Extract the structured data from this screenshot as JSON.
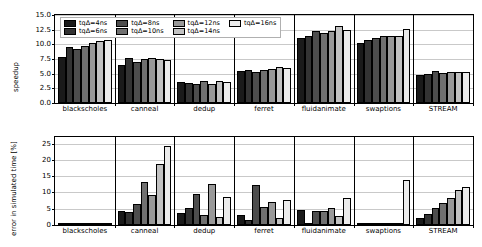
{
  "figure": {
    "panels": [
      "speedup",
      "error"
    ]
  },
  "legend": {
    "entries": [
      {
        "label": "tqΔ=4ns",
        "color": "#1a1a1a"
      },
      {
        "label": "tqΔ=6ns",
        "color": "#333333"
      },
      {
        "label": "tqΔ=8ns",
        "color": "#4d4d4d"
      },
      {
        "label": "tqΔ=10ns",
        "color": "#707070"
      },
      {
        "label": "tqΔ=12ns",
        "color": "#999999"
      },
      {
        "label": "tqΔ=14ns",
        "color": "#c2c2c2"
      },
      {
        "label": "tqΔ=16ns",
        "color": "#ebebeb"
      }
    ]
  },
  "chart_data": [
    {
      "type": "bar",
      "title": "",
      "xlabel": "",
      "ylabel": "speedup",
      "ylim": [
        0.0,
        15.0
      ],
      "yticks": [
        "0.0",
        "2.5",
        "5.0",
        "7.5",
        "10.0",
        "12.5",
        "15.0"
      ],
      "ytick_values": [
        0.0,
        2.5,
        5.0,
        7.5,
        10.0,
        12.5,
        15.0
      ],
      "grid": true,
      "legend_position": "upper left",
      "categories": [
        "blackscholes",
        "canneal",
        "dedup",
        "ferret",
        "fluidanimate",
        "swaptions",
        "STREAM"
      ],
      "series": [
        {
          "name": "tqΔ=4ns",
          "values": [
            7.8,
            6.4,
            3.5,
            5.5,
            11.1,
            10.3,
            4.7
          ]
        },
        {
          "name": "tqΔ=6ns",
          "values": [
            9.5,
            7.7,
            3.4,
            5.6,
            11.5,
            10.8,
            5.0
          ]
        },
        {
          "name": "tqΔ=8ns",
          "values": [
            9.2,
            7.0,
            3.3,
            5.3,
            12.2,
            11.1,
            5.5
          ]
        },
        {
          "name": "tqΔ=10ns",
          "values": [
            9.8,
            7.5,
            3.7,
            5.6,
            12.0,
            11.4,
            5.2
          ]
        },
        {
          "name": "tqΔ=12ns",
          "values": [
            10.2,
            7.7,
            3.2,
            5.8,
            12.3,
            11.4,
            5.3
          ]
        },
        {
          "name": "tqΔ=14ns",
          "values": [
            10.5,
            7.5,
            3.8,
            6.1,
            13.1,
            11.5,
            5.3
          ]
        },
        {
          "name": "tqΔ=16ns",
          "values": [
            10.8,
            7.3,
            3.6,
            5.9,
            12.4,
            12.6,
            5.35
          ]
        }
      ]
    },
    {
      "type": "bar",
      "title": "",
      "xlabel": "",
      "ylabel": "error in simulated time [%]",
      "ylim": [
        0,
        27
      ],
      "yticks": [
        "0",
        "5",
        "10",
        "15",
        "20",
        "25"
      ],
      "ytick_values": [
        0,
        5,
        10,
        15,
        20,
        25
      ],
      "grid": true,
      "legend_position": "none",
      "categories": [
        "blackscholes",
        "canneal",
        "dedup",
        "ferret",
        "fluidanimate",
        "swaptions",
        "STREAM"
      ],
      "series": [
        {
          "name": "tqΔ=4ns",
          "values": [
            0.15,
            4.3,
            3.7,
            3.0,
            4.7,
            0.1,
            2.2
          ]
        },
        {
          "name": "tqΔ=6ns",
          "values": [
            0.12,
            4.0,
            5.3,
            1.4,
            0.3,
            0.1,
            3.5
          ]
        },
        {
          "name": "tqΔ=8ns",
          "values": [
            0.18,
            6.3,
            9.6,
            12.2,
            4.2,
            0.1,
            5.2
          ]
        },
        {
          "name": "tqΔ=10ns",
          "values": [
            0.15,
            13.2,
            3.2,
            5.6,
            4.2,
            0.1,
            6.7
          ]
        },
        {
          "name": "tqΔ=12ns",
          "values": [
            0.2,
            9.2,
            12.5,
            7.1,
            5.3,
            0.1,
            8.4
          ]
        },
        {
          "name": "tqΔ=14ns",
          "values": [
            0.2,
            18.7,
            2.6,
            2.3,
            2.9,
            0.1,
            10.6
          ]
        },
        {
          "name": "tqΔ=16ns",
          "values": [
            0.3,
            24.1,
            8.7,
            7.7,
            8.3,
            13.8,
            11.8
          ]
        }
      ]
    }
  ]
}
